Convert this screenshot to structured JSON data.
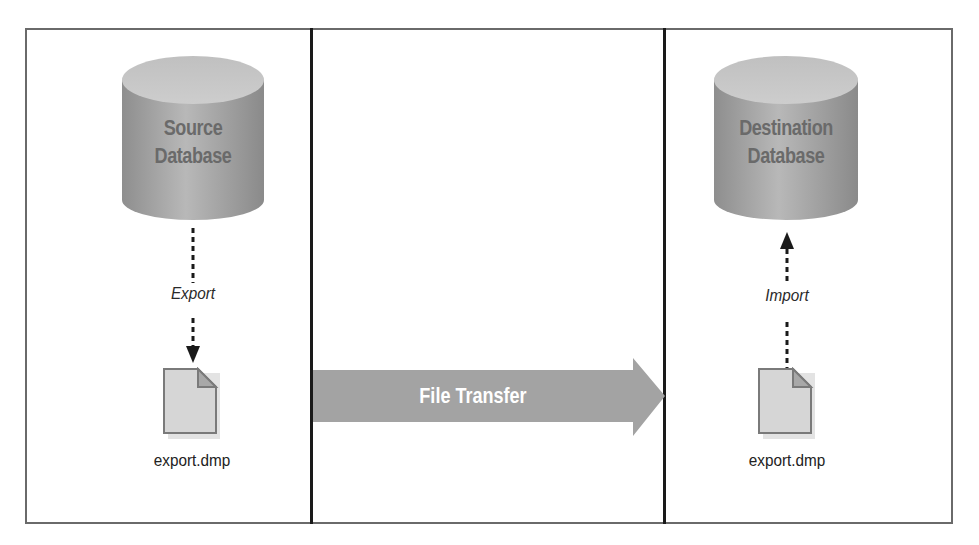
{
  "diagram": {
    "source": {
      "database_label_line1": "Source",
      "database_label_line2": "Database",
      "operation_label": "Export",
      "file_label": "export.dmp"
    },
    "transfer": {
      "label": "File Transfer"
    },
    "destination": {
      "database_label_line1": "Destination",
      "database_label_line2": "Database",
      "operation_label": "Import",
      "file_label": "export.dmp"
    },
    "colors": {
      "cylinder_body": "#a8a8a8",
      "cylinder_top": "#c4c4c4",
      "arrow_fill": "#a3a3a3",
      "file_fill": "#d6d6d6",
      "file_border": "#7a7a7a",
      "divider": "#1a1a1a",
      "frame_border": "#6a6a6a"
    }
  }
}
